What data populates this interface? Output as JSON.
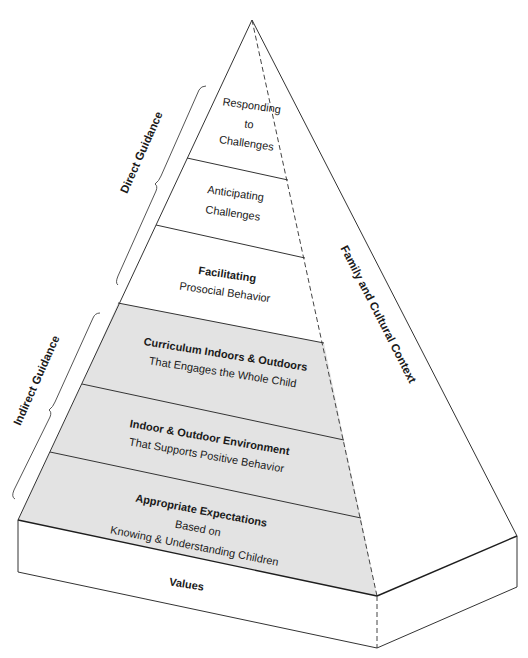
{
  "diagram": {
    "colors": {
      "indirect_fill": "#e3e3e3",
      "direct_fill": "#ffffff",
      "line": "#333333",
      "text": "#1a1a1a"
    },
    "layers": [
      {
        "id": "responding",
        "group": "direct",
        "lines": [
          "Responding",
          "to",
          "Challenges"
        ],
        "bold_first": false
      },
      {
        "id": "anticipating",
        "group": "direct",
        "lines": [
          "Anticipating",
          "Challenges"
        ],
        "bold_first": false
      },
      {
        "id": "facilitating",
        "group": "direct",
        "title": "Facilitating",
        "subtitle": "Prosocial Behavior"
      },
      {
        "id": "curriculum",
        "group": "indirect",
        "title": "Curriculum Indoors & Outdoors",
        "subtitle": "That Engages the Whole Child"
      },
      {
        "id": "environment",
        "group": "indirect",
        "title": "Indoor & Outdoor Environment",
        "subtitle": "That Supports Positive Behavior"
      },
      {
        "id": "expectations",
        "group": "indirect",
        "title": "Appropriate Expectations",
        "subtitle_lines": [
          "Based on",
          "Knowing & Understanding Children"
        ]
      }
    ],
    "base": {
      "label": "Values"
    },
    "side_face": {
      "label": "Family and Cultural Context"
    },
    "brackets": {
      "direct": {
        "label": "Direct Guidance"
      },
      "indirect": {
        "label": "Indirect Guidance"
      }
    }
  }
}
